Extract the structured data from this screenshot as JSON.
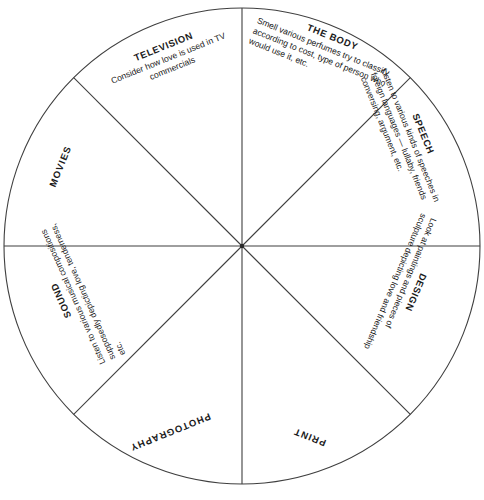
{
  "diagram": {
    "type": "segmented-circle-wheel",
    "segment_count": 8,
    "geometry": {
      "center_x": 242,
      "center_y": 246,
      "radius": 238,
      "stroke_color": "#3a3a3a",
      "stroke_width": 1,
      "fill_color": "#ffffff",
      "background_color": "#ffffff",
      "spoke_angles_deg": [
        0,
        45,
        90,
        135,
        180,
        225,
        270,
        315
      ]
    },
    "segments": [
      {
        "id": "television",
        "title": "TELEVISION",
        "description": "Consider how love is used in TV commercials",
        "position": "upper-left"
      },
      {
        "id": "the-body",
        "title": "THE BODY",
        "description": "Smell various perfumes try to classify according to cost, type of person who would use it, etc.",
        "position": "upper-right"
      },
      {
        "id": "speech",
        "title": "SPEECH",
        "description": "Listen to various kinds of speeches in foreign languages — lullaby, friends conversing, argument, etc.",
        "position": "right-upper"
      },
      {
        "id": "design",
        "title": "DESIGN",
        "description": "Look at paintings and pieces of sculpture depicting love and friendship",
        "position": "right-lower"
      },
      {
        "id": "print",
        "title": "PRINT",
        "description": "",
        "position": "lower-right"
      },
      {
        "id": "photography",
        "title": "PHOTOGRAPHY",
        "description": "",
        "position": "lower-left"
      },
      {
        "id": "sound",
        "title": "SOUND",
        "description": "Listen to various musical compositions supposedly depicting love, tenderness, etc.",
        "position": "left-lower"
      },
      {
        "id": "movies",
        "title": "MOVIES",
        "description": "",
        "position": "left-upper"
      }
    ]
  }
}
